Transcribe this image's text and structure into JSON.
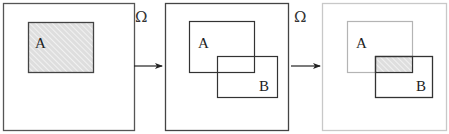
{
  "diagram": {
    "universe_symbol": "Ω",
    "panels": [
      {
        "id": "panel-1",
        "outer": {
          "x": 3,
          "y": 3,
          "w": 131,
          "h": 127,
          "stroke": "#555555"
        },
        "sets": [
          {
            "label": "A",
            "x": 28,
            "y": 22,
            "w": 65,
            "h": 50,
            "stroke": "#444444",
            "hatched": true,
            "label_x": 35,
            "label_y": 48
          }
        ]
      },
      {
        "id": "panel-2",
        "outer": {
          "x": 165,
          "y": 3,
          "w": 123,
          "h": 127,
          "stroke": "#444444"
        },
        "sets": [
          {
            "label": "A",
            "x": 189,
            "y": 21,
            "w": 65,
            "h": 51,
            "stroke": "#333333",
            "hatched": false,
            "label_x": 198,
            "label_y": 48
          },
          {
            "label": "B",
            "x": 217,
            "y": 56,
            "w": 60,
            "h": 41,
            "stroke": "#333333",
            "hatched": false,
            "label_x": 259,
            "label_y": 91
          }
        ]
      },
      {
        "id": "panel-3",
        "outer": {
          "x": 322,
          "y": 3,
          "w": 124,
          "h": 127,
          "stroke": "#c8c8c8"
        },
        "sets": [
          {
            "label": "A",
            "x": 347,
            "y": 21,
            "w": 65,
            "h": 51,
            "stroke": "#b4b4b4",
            "hatched": false,
            "label_x": 356,
            "label_y": 48
          },
          {
            "label": "B",
            "x": 375,
            "y": 56,
            "w": 57,
            "h": 41,
            "stroke": "#333333",
            "hatched": false,
            "label_x": 416,
            "label_y": 91
          }
        ],
        "intersection": {
          "x": 375,
          "y": 56,
          "w": 37,
          "h": 16,
          "hatched": true
        }
      }
    ],
    "arrows": [
      {
        "x1": 134,
        "x2": 162,
        "y": 66,
        "omega_x": 135,
        "omega_y": 22
      },
      {
        "x1": 291,
        "x2": 320,
        "y": 66,
        "omega_x": 294,
        "omega_y": 22
      }
    ],
    "colors": {
      "hatch_fill": "#e2e2e2",
      "hatch_line": "#ffffff",
      "arrow": "#222222"
    }
  }
}
